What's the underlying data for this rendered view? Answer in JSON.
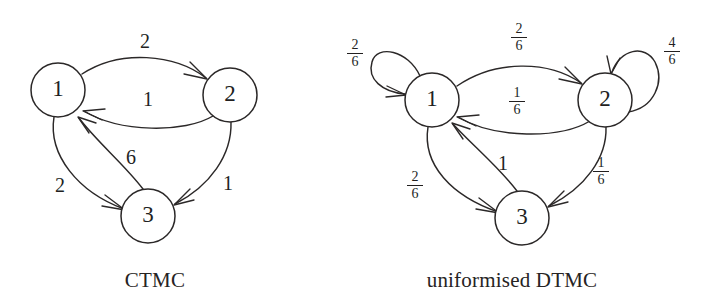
{
  "figure": {
    "panels": [
      {
        "id": "ctmc",
        "caption": "CTMC",
        "nodes": [
          {
            "id": "n1",
            "label": "1",
            "cx": 58,
            "cy": 90,
            "r": 27
          },
          {
            "id": "n2",
            "label": "2",
            "cx": 230,
            "cy": 95,
            "r": 27
          },
          {
            "id": "n3",
            "label": "3",
            "cx": 148,
            "cy": 216,
            "r": 27
          }
        ],
        "edges": [
          {
            "id": "e12",
            "from": "1",
            "to": "2",
            "label": "2",
            "label_x": 145,
            "label_y": 48
          },
          {
            "id": "e21",
            "from": "2",
            "to": "1",
            "label": "1",
            "label_x": 148,
            "label_y": 106
          },
          {
            "id": "e13",
            "from": "1",
            "to": "3",
            "label": "2",
            "label_x": 60,
            "label_y": 192
          },
          {
            "id": "e31",
            "from": "3",
            "to": "1",
            "label": "6",
            "label_x": 131,
            "label_y": 164
          },
          {
            "id": "e23",
            "from": "2",
            "to": "3",
            "label": "1",
            "label_x": 228,
            "label_y": 190
          }
        ],
        "self_loops": []
      },
      {
        "id": "uniformised-dtmc",
        "caption": "uniformised DTMC",
        "nodes": [
          {
            "id": "n1",
            "label": "1",
            "cx": 432,
            "cy": 100,
            "r": 27
          },
          {
            "id": "n2",
            "label": "2",
            "cx": 605,
            "cy": 100,
            "r": 27
          },
          {
            "id": "n3",
            "label": "3",
            "cx": 522,
            "cy": 218,
            "r": 27
          }
        ],
        "edges": [
          {
            "id": "e12",
            "from": "1",
            "to": "2",
            "numerator": "2",
            "denominator": "6",
            "label_x": 518,
            "label_y": 28
          },
          {
            "id": "e21",
            "from": "2",
            "to": "1",
            "numerator": "1",
            "denominator": "6",
            "label_x": 516,
            "label_y": 92
          },
          {
            "id": "e13",
            "from": "1",
            "to": "3",
            "numerator": "2",
            "denominator": "6",
            "label_x": 414,
            "label_y": 176
          },
          {
            "id": "e31",
            "from": "3",
            "to": "1",
            "label": "1",
            "label_x": 503,
            "label_y": 170
          },
          {
            "id": "e23",
            "from": "2",
            "to": "3",
            "numerator": "1",
            "denominator": "6",
            "label_x": 600,
            "label_y": 162
          }
        ],
        "self_loops": [
          {
            "id": "l1",
            "on": "1",
            "numerator": "2",
            "denominator": "6",
            "label_x": 354,
            "label_y": 44
          },
          {
            "id": "l2",
            "on": "2",
            "numerator": "4",
            "denominator": "6",
            "label_x": 671,
            "label_y": 42
          }
        ]
      }
    ]
  }
}
